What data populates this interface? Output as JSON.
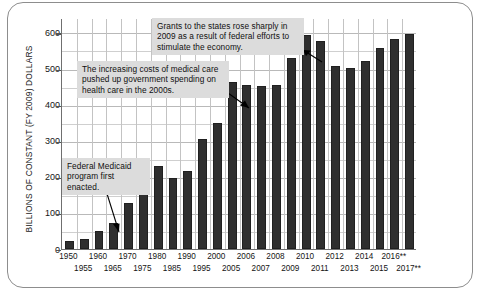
{
  "figure": {
    "ylabel": "BILLIONS OF CONSTANT (FY 2009) DOLLARS"
  },
  "annotations": {
    "grants": "Grants to the states rose sharply in 2009 as a result of federal efforts to stimulate the economy.",
    "medical": "The increasing costs of medical care pushed up government spending on health care in the 2000s.",
    "medicaid": "Federal Medicaid program first enacted."
  },
  "chart_data": {
    "type": "bar",
    "title": "",
    "xlabel": "",
    "ylabel": "BILLIONS OF CONSTANT (FY 2009) DOLLARS",
    "ylim": [
      0,
      640
    ],
    "yticks": [
      0,
      100,
      200,
      300,
      400,
      500,
      600
    ],
    "ytick_labels": [
      "0",
      "100",
      "200",
      "300",
      "400",
      "500",
      "600"
    ],
    "minor_gridline_step": 50,
    "grid": true,
    "legend": "none",
    "bar_color": "#2f2f2f",
    "categories": [
      "1950",
      "1955",
      "1960",
      "1965",
      "1970",
      "1975",
      "1980",
      "1985",
      "1990",
      "1995",
      "2000",
      "2005",
      "2006",
      "2007",
      "2008",
      "2009",
      "2010",
      "2011",
      "2012",
      "2013",
      "2014",
      "2015",
      "2016**",
      "2017**"
    ],
    "values": [
      22,
      28,
      50,
      71,
      127,
      183,
      229,
      197,
      215,
      305,
      348,
      463,
      455,
      453,
      455,
      530,
      592,
      576,
      507,
      502,
      522,
      558,
      581,
      595
    ],
    "annotations": [
      "Grants to the states rose sharply in 2009 as a result of federal efforts to stimulate the economy.",
      "The increasing costs of medical care pushed up government spending on health care in the 2000s.",
      "Federal Medicaid program first enacted."
    ],
    "footnote_marker": "**"
  }
}
